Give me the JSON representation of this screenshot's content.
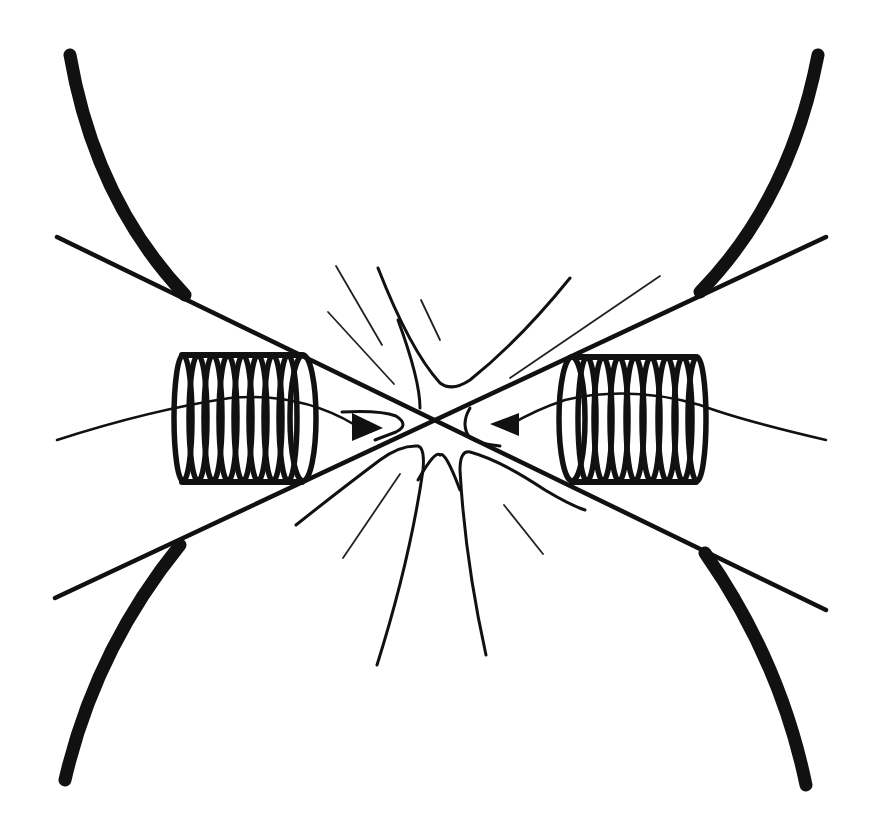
{
  "diagram": {
    "title": "",
    "colors": {
      "background": "#ffffff",
      "ink": "#111111"
    },
    "elements": {
      "left_coil": {
        "turns": 9,
        "arrow_direction": "right"
      },
      "right_coil": {
        "turns": 9,
        "arrow_direction": "left"
      },
      "separatrix_lines": 2,
      "boundary_curves": 4
    }
  }
}
